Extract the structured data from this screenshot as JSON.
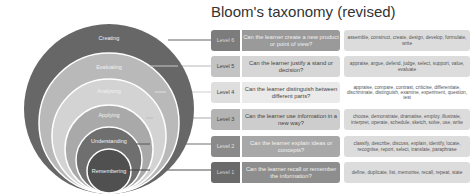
{
  "title": "Bloom's taxonomy (revised)",
  "colors": {
    "circle_creating": "#676767",
    "circle_evaluating": "#b9b9b9",
    "circle_analysing": "#d3d3d3",
    "circle_applying": "#a9a9a9",
    "circle_understanding": "#6f6f6f",
    "circle_remembering": "#505050",
    "verbs_bg": "#dcdcdc"
  },
  "circles": [
    {
      "label": "Creating"
    },
    {
      "label": "Evaluating"
    },
    {
      "label": "Analysing"
    },
    {
      "label": "Applying"
    },
    {
      "label": "Understanding"
    },
    {
      "label": "Remembering"
    }
  ],
  "levels": [
    {
      "level": "Level 6",
      "question": "Can the learner create a new product or point of view?",
      "verbs": "assemble, construct, create, design, develop, formulate, write"
    },
    {
      "level": "Level 5",
      "question": "Can the learner justify a stand or decision?",
      "verbs": "appraise, argue, defend, judge, select, support, value, evaluate"
    },
    {
      "level": "Level 4",
      "question": "Can the learner distinguish between different parts?",
      "verbs": "appraise, compare, contrast, criticise, differentiate, discriminate, distinguish, examine, experiment, question, test"
    },
    {
      "level": "Level 3",
      "question": "Can the learner use information in a new way?",
      "verbs": "choose, demonstrate, dramatise, employ, illustrate, interpret, operate, schedule, sketch, solve, use, write"
    },
    {
      "level": "Level 2",
      "question": "Can the learner explain ideas or concepts?",
      "verbs": "classify, describe, discuss, explain, identify, locate, recognise, report, select, translate, paraphrase"
    },
    {
      "level": "Level 1",
      "question": "Can the learner recall or remember the information?",
      "verbs": "define, duplicate, list, memorise, recall, repeat, state"
    }
  ]
}
